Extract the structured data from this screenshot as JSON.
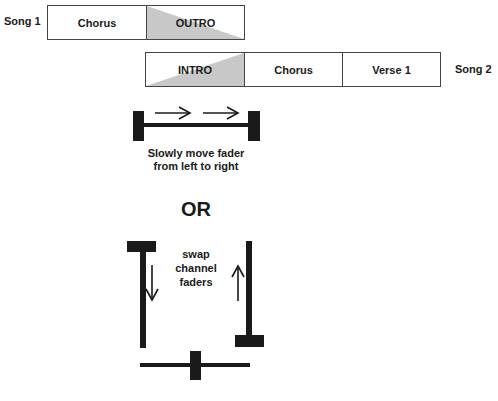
{
  "song1": {
    "label": "Song 1",
    "segments": [
      {
        "label": "Chorus",
        "fade": "none"
      },
      {
        "label": "OUTRO",
        "fade": "out"
      }
    ]
  },
  "song2": {
    "label": "Song 2",
    "segments": [
      {
        "label": "INTRO",
        "fade": "in"
      },
      {
        "label": "Chorus",
        "fade": "none"
      },
      {
        "label": "Verse 1",
        "fade": "none"
      }
    ]
  },
  "crossfader": {
    "caption_line1": "Slowly move fader",
    "caption_line2": "from left to right",
    "arrows": [
      "right-arrow",
      "right-arrow"
    ]
  },
  "or_label": "OR",
  "channel_faders": {
    "caption_line1": "swap",
    "caption_line2": "channel",
    "caption_line3": "faders",
    "left_direction": "down",
    "right_direction": "up"
  },
  "colors": {
    "fade_fill": "#c8c8c8",
    "ink": "#1a1a1a",
    "border": "#444444"
  }
}
